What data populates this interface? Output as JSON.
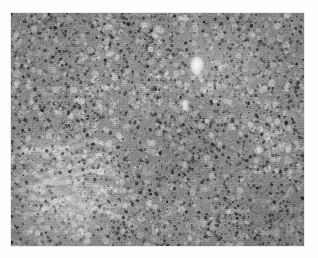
{
  "page": {
    "background_color": "#ffffff",
    "width": 318,
    "height": 258
  },
  "artifact": {
    "name": "scan-smudge",
    "description": "faint grey scanner smudge, top-left corner",
    "color": "#e8e8e8"
  },
  "figure": {
    "name": "histopathology-micrograph",
    "modality": "light-microscopy",
    "stain": "H&E",
    "rendering": "grayscale",
    "bounds": {
      "x": 11,
      "y": 13,
      "width": 293,
      "height": 233
    },
    "tone": {
      "mean_gray": "#8c8c8c",
      "darkest": "#2a2a2a",
      "lightest": "#f2f2f2",
      "border_color": "#787878"
    },
    "features": [
      {
        "name": "dense-lymphoid-field",
        "description": "diffuse sheet of small dark round nuclei filling the field",
        "region": "entire frame"
      },
      {
        "name": "vascular-lumen",
        "description": "bright ovoid clear space, likely a small vessel lumen",
        "region": "upper middle-right"
      },
      {
        "name": "secondary-lumen",
        "description": "smaller pale ovoid clear space below the main vessel",
        "region": "centre-right upper"
      },
      {
        "name": "fibrous-trabecula",
        "description": "pale diagonal band of less cellular fibrous stroma",
        "region": "lower left"
      },
      {
        "name": "paracortical-pale-zone",
        "description": "slightly lighter, less densely packed area",
        "region": "upper right"
      }
    ],
    "texture": {
      "nucleus_count_estimate": 2600,
      "nucleus_diameter_px": [
        1.4,
        3.6
      ],
      "seed": 20240517
    }
  },
  "caption": {
    "text": ""
  }
}
